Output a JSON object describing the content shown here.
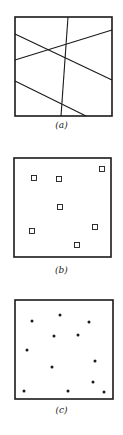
{
  "panels": [
    {
      "label": "(a)",
      "type": "lines",
      "box": [
        15,
        17,
        112,
        116
      ],
      "lines": [
        [
          68,
          17,
          61,
          116
        ],
        [
          15,
          34,
          112,
          80
        ],
        [
          15,
          60,
          112,
          30
        ],
        [
          15,
          81,
          86,
          116
        ]
      ]
    },
    {
      "label": "(b)",
      "type": "squares",
      "box": [
        14,
        158,
        111,
        257
      ],
      "points": [
        [
          34,
          178
        ],
        [
          59,
          179
        ],
        [
          102,
          169
        ],
        [
          60,
          207
        ],
        [
          32,
          231
        ],
        [
          95,
          227
        ],
        [
          77,
          245
        ]
      ]
    },
    {
      "label": "(c)",
      "type": "dots",
      "box": [
        15,
        300,
        113,
        399
      ],
      "points": [
        [
          32,
          321
        ],
        [
          60,
          315
        ],
        [
          89,
          322
        ],
        [
          54,
          336
        ],
        [
          78,
          335
        ],
        [
          27,
          350
        ],
        [
          95,
          361
        ],
        [
          52,
          367
        ],
        [
          93,
          382
        ],
        [
          24,
          391
        ],
        [
          68,
          391
        ],
        [
          104,
          392
        ]
      ]
    }
  ],
  "colors": {
    "stroke": "#1a1a1a",
    "background": "#ffffff"
  }
}
